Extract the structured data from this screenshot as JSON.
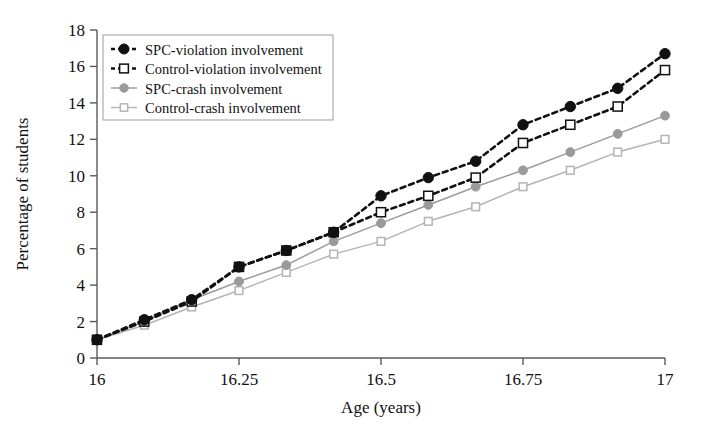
{
  "chart_data": {
    "type": "line",
    "title": "",
    "xlabel": "Age (years)",
    "ylabel": "Percentage of students",
    "xlim": [
      16,
      17
    ],
    "ylim": [
      0,
      18
    ],
    "xticks": [
      16,
      16.25,
      16.5,
      16.75,
      17
    ],
    "xtick_labels": [
      "16",
      "16.25",
      "16.5",
      "16.75",
      "17"
    ],
    "yticks": [
      0,
      2,
      4,
      6,
      8,
      10,
      12,
      14,
      16,
      18
    ],
    "ytick_labels": [
      "0",
      "2",
      "4",
      "6",
      "8",
      "10",
      "12",
      "14",
      "16",
      "18"
    ],
    "grid": false,
    "legend_position": "upper-left",
    "x": [
      16.0,
      16.0833,
      16.1667,
      16.25,
      16.3333,
      16.4167,
      16.5,
      16.5833,
      16.6667,
      16.75,
      16.8333,
      16.9167,
      17.0
    ],
    "series": [
      {
        "name": "SPC-violation involvement",
        "marker": "filled-circle",
        "line": "dashed",
        "color": "#111111",
        "values": [
          1.0,
          2.1,
          3.2,
          5.0,
          5.9,
          6.9,
          8.9,
          9.9,
          10.8,
          12.8,
          13.8,
          14.8,
          16.7
        ]
      },
      {
        "name": "Control-violation involvement",
        "marker": "open-square",
        "line": "dashed",
        "color": "#111111",
        "values": [
          1.0,
          2.0,
          3.1,
          5.0,
          5.9,
          6.9,
          8.0,
          8.9,
          9.9,
          11.8,
          12.8,
          13.8,
          15.8
        ]
      },
      {
        "name": "SPC-crash involvement",
        "marker": "filled-circle",
        "line": "solid",
        "color": "#9a9a9a",
        "values": [
          1.0,
          2.0,
          3.2,
          4.2,
          5.1,
          6.4,
          7.4,
          8.4,
          9.4,
          10.3,
          11.3,
          12.3,
          13.3
        ]
      },
      {
        "name": "Control-crash involvement",
        "marker": "open-square",
        "line": "solid",
        "color": "#b4b4b4",
        "values": [
          1.0,
          1.8,
          2.8,
          3.7,
          4.7,
          5.7,
          6.4,
          7.5,
          8.3,
          9.4,
          10.3,
          11.3,
          12.0
        ]
      }
    ]
  },
  "axes": {
    "x_title": "Age (years)",
    "y_title": "Percentage of students"
  },
  "legend": {
    "items": [
      {
        "label": "SPC-violation involvement"
      },
      {
        "label": "Control-violation involvement"
      },
      {
        "label": "SPC-crash involvement"
      },
      {
        "label": "Control-crash involvement"
      }
    ]
  },
  "colors": {
    "dark": "#111111",
    "spc_crash": "#9a9a9a",
    "control_crash": "#b4b4b4",
    "axis": "#5a5a5a",
    "background": "#ffffff"
  }
}
